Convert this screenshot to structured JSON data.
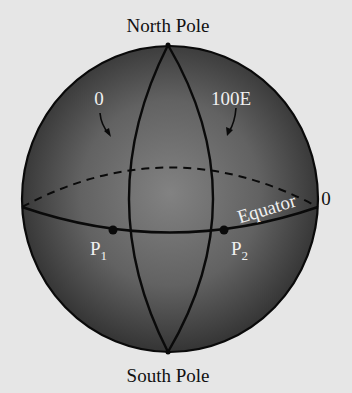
{
  "diagram": {
    "labels": {
      "north_pole": "North Pole",
      "south_pole": "South Pole",
      "meridian_0": "0",
      "meridian_100e": "100E",
      "equator": "Equator",
      "equator_latitude": "0",
      "point1_letter": "P",
      "point1_sub": "1",
      "point2_letter": "P",
      "point2_sub": "2"
    },
    "colors": {
      "background": "#e6e6e6",
      "sphere_center": "#7d7d7d",
      "sphere_edge": "#2e2e2e",
      "line": "#0a0a0a",
      "label_on_sphere": "#f0f0f0",
      "label_outside": "#111111"
    }
  }
}
